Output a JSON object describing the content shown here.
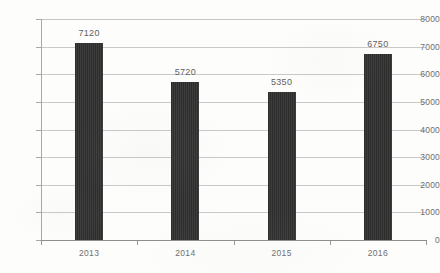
{
  "chart_data": {
    "type": "bar",
    "title": "",
    "subtitle": "",
    "xlabel": "",
    "ylabel": "",
    "categories": [
      "2013",
      "2014",
      "2015",
      "2016"
    ],
    "values": [
      7120,
      5720,
      5350,
      6750
    ],
    "data_labels": [
      "7120",
      "5720",
      "5350",
      "6750"
    ],
    "ylim": [
      0,
      8000
    ],
    "ytick_labels": [
      "8000",
      "7000",
      "6000",
      "5000",
      "4000",
      "3000",
      "2000",
      "1000",
      "0"
    ],
    "ytick_values": [
      8000,
      7000,
      6000,
      5000,
      4000,
      3000,
      2000,
      1000,
      0
    ],
    "ytick_step": 1000,
    "grid": true,
    "grid_axis": "y",
    "legend": false,
    "legend_position": "none",
    "series": [
      {
        "name": "",
        "values": [
          7120,
          5720,
          5350,
          6750
        ]
      }
    ],
    "colors": {
      "bar_fill": "#2c2c2c",
      "gridline": "#c9c9c9",
      "axis_line": "#8e8e8e",
      "tick_label": "#6f6f6f",
      "value_label": "#5f5f5f",
      "background": "#fdfdfc"
    }
  }
}
